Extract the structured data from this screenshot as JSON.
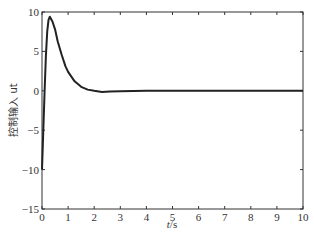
{
  "chart_data": {
    "type": "line",
    "title": "",
    "xlabel": "t/s",
    "ylabel": "控制输入 ut",
    "xlim": [
      0,
      10
    ],
    "ylim": [
      -15,
      10
    ],
    "xticks": [
      0,
      1,
      2,
      3,
      4,
      5,
      6,
      7,
      8,
      9,
      10
    ],
    "yticks": [
      -15,
      -10,
      -5,
      0,
      5,
      10
    ],
    "grid": false,
    "legend": null,
    "series": [
      {
        "name": "ut",
        "color": "#222222",
        "x": [
          0,
          0.05,
          0.1,
          0.15,
          0.2,
          0.25,
          0.3,
          0.4,
          0.5,
          0.6,
          0.75,
          0.9,
          1.0,
          1.25,
          1.5,
          1.75,
          2.0,
          2.3,
          2.6,
          3.0,
          4.0,
          5.0,
          6.0,
          7.0,
          8.0,
          9.0,
          10.0
        ],
        "y": [
          -10,
          -5,
          0,
          4.5,
          7.5,
          9.0,
          9.4,
          8.8,
          7.8,
          6.3,
          4.6,
          3.1,
          2.4,
          1.2,
          0.5,
          0.15,
          0.0,
          -0.15,
          -0.1,
          -0.05,
          0,
          0,
          0,
          0,
          0,
          0,
          0
        ]
      }
    ]
  },
  "labels": {
    "xlabel_italic": "t",
    "xlabel_unit": "/s",
    "ylabel": "控制输入 ut"
  }
}
